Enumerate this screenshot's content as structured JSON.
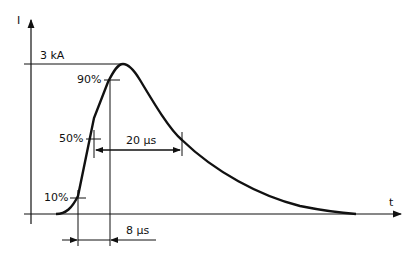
{
  "diagram": {
    "axes": {
      "y_label": "I",
      "x_label": "t"
    },
    "peak_label": "3 kA",
    "levels": {
      "p90": "90%",
      "p50": "50%",
      "p10": "10%"
    },
    "durations": {
      "half_value": "20 µs",
      "front": "8 µs"
    },
    "colors": {
      "line": "#111111",
      "background": "#ffffff"
    }
  }
}
